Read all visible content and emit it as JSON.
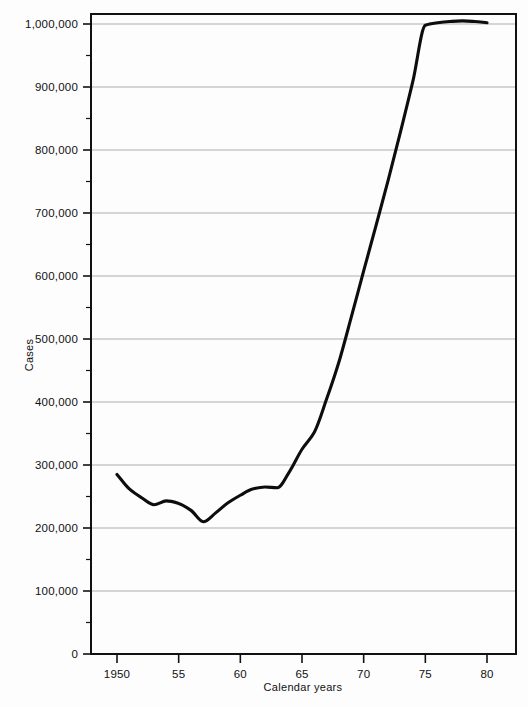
{
  "chart_data": {
    "type": "line",
    "title": "",
    "xlabel": "Calendar years",
    "ylabel": "Cases",
    "xlim": [
      1949.0,
      1981.0
    ],
    "ylim": [
      0,
      1050000
    ],
    "grid": true,
    "legend": "none",
    "x_ticks": [
      {
        "value": 1950,
        "label": "1950"
      },
      {
        "value": 1955,
        "label": "55"
      },
      {
        "value": 1960,
        "label": "60"
      },
      {
        "value": 1965,
        "label": "65"
      },
      {
        "value": 1970,
        "label": "70"
      },
      {
        "value": 1975,
        "label": "75"
      },
      {
        "value": 1980,
        "label": "80"
      }
    ],
    "y_ticks": [
      {
        "value": 0,
        "label": "0"
      },
      {
        "value": 100000,
        "label": "100,000"
      },
      {
        "value": 200000,
        "label": "200,000"
      },
      {
        "value": 300000,
        "label": "300,000"
      },
      {
        "value": 400000,
        "label": "400,000"
      },
      {
        "value": 500000,
        "label": "500,000"
      },
      {
        "value": 600000,
        "label": "600,000"
      },
      {
        "value": 700000,
        "label": "700,000"
      },
      {
        "value": 800000,
        "label": "800,000"
      },
      {
        "value": 900000,
        "label": "900,000"
      },
      {
        "value": 1000000,
        "label": "1,000,000"
      }
    ],
    "y_minor_ticks": [
      50000,
      150000,
      250000,
      350000,
      450000,
      550000,
      650000,
      750000,
      850000,
      950000
    ],
    "series": [
      {
        "name": "Cases",
        "color": "#0d0d0d",
        "x": [
          1950,
          1951,
          1952,
          1953,
          1954,
          1955,
          1956,
          1957,
          1958,
          1959,
          1960,
          1961,
          1962,
          1963,
          1964,
          1965,
          1966,
          1967,
          1968,
          1969,
          1970,
          1971,
          1972,
          1973,
          1974,
          1975,
          1976,
          1977,
          1978,
          1979,
          1980
        ],
        "values": [
          285000,
          262000,
          248000,
          237000,
          243000,
          239000,
          228000,
          210000,
          224000,
          240000,
          252000,
          262000,
          265000,
          264000,
          290000,
          325000,
          352000,
          405000,
          464000,
          535000,
          608000,
          680000,
          753000,
          830000,
          910000,
          998000,
          1002000,
          1004000,
          1005000,
          1004000,
          1002000
        ]
      }
    ]
  },
  "axes": {
    "ylabel": "Cases",
    "xlabel": "Calendar years"
  },
  "colors": {
    "line": "#0d0d0d",
    "grid": "#8a8a8a",
    "frame": "#111111",
    "background": "#fdfdfd"
  }
}
